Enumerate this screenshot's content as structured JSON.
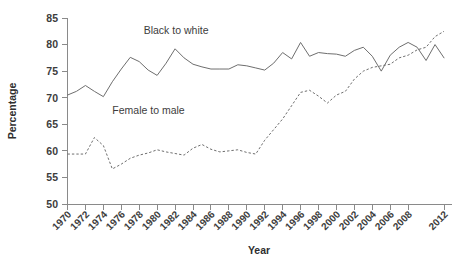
{
  "chart_data": {
    "type": "line",
    "title": "",
    "xlabel": "Year",
    "ylabel": "Percentage",
    "xlim": [
      1970,
      2012
    ],
    "ylim": [
      50,
      85
    ],
    "ytick_labels": [
      "85",
      "80",
      "75",
      "70",
      "65",
      "60",
      "55",
      "50"
    ],
    "ytick_values": [
      85,
      80,
      75,
      70,
      65,
      60,
      55,
      50
    ],
    "xtick_labels": [
      "1970",
      "1972",
      "1974",
      "1976",
      "1978",
      "1980",
      "1982",
      "1984",
      "1986",
      "1988",
      "1990",
      "1992",
      "1994",
      "1996",
      "1998",
      "2000",
      "2002",
      "2004",
      "2006",
      "2008",
      "2012"
    ],
    "xtick_values": [
      1970,
      1972,
      1974,
      1976,
      1978,
      1980,
      1982,
      1984,
      1986,
      1988,
      1990,
      1992,
      1994,
      1996,
      1998,
      2000,
      2002,
      2004,
      2006,
      2008,
      2012
    ],
    "grid": false,
    "legend_position": "inline-annotations",
    "x": [
      1970,
      1971,
      1972,
      1973,
      1974,
      1975,
      1976,
      1977,
      1978,
      1979,
      1980,
      1981,
      1982,
      1983,
      1984,
      1985,
      1986,
      1987,
      1988,
      1989,
      1990,
      1991,
      1992,
      1993,
      1994,
      1995,
      1996,
      1997,
      1998,
      1999,
      2000,
      2001,
      2002,
      2003,
      2004,
      2005,
      2006,
      2007,
      2008,
      2009,
      2010,
      2011,
      2012
    ],
    "series": [
      {
        "name": "Black to white",
        "style": "solid",
        "color": "#6e6e6e",
        "label_x": 1978.5,
        "label_y": 82.0,
        "values": [
          70.5,
          71.2,
          72.3,
          71.2,
          70.2,
          73.0,
          75.4,
          77.6,
          76.8,
          75.2,
          74.2,
          76.5,
          79.2,
          77.5,
          76.3,
          75.8,
          75.4,
          75.4,
          75.4,
          76.2,
          76.0,
          75.6,
          75.2,
          76.5,
          78.5,
          77.3,
          80.4,
          77.8,
          78.5,
          78.3,
          78.2,
          77.8,
          78.9,
          79.5,
          77.8,
          75.0,
          78.0,
          79.5,
          80.4,
          79.5,
          77.0,
          80.0,
          77.5
        ]
      },
      {
        "name": "Female to male",
        "style": "dashed",
        "color": "#6e6e6e",
        "label_x": 1975.0,
        "label_y": 67.0,
        "values": [
          59.4,
          59.4,
          59.4,
          62.5,
          61.0,
          56.6,
          57.5,
          58.6,
          59.2,
          59.6,
          60.2,
          59.8,
          59.5,
          59.2,
          60.5,
          61.2,
          60.3,
          59.8,
          60.0,
          60.2,
          59.7,
          59.4,
          62.0,
          64.0,
          66.0,
          68.5,
          71.0,
          71.4,
          70.3,
          69.0,
          70.5,
          71.2,
          73.5,
          75.0,
          75.7,
          76.0,
          76.3,
          77.5,
          78.0,
          79.0,
          79.5,
          81.5,
          82.5
        ]
      }
    ]
  },
  "chart": {
    "ylabel": "Percentage",
    "xlabel": "Year",
    "annotation_black_to_white": "Black to white",
    "annotation_female_to_male": "Female to male"
  },
  "colors": {
    "line": "#6e6e6e",
    "axis": "#8a8a8a",
    "text": "#3d3d3d",
    "background": "#ffffff"
  }
}
